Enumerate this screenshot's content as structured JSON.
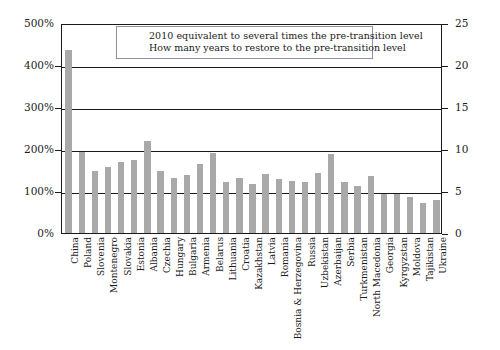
{
  "chart_data": {
    "type": "bar",
    "title": "",
    "subtitle": "",
    "xlabel": "",
    "ylabel": "",
    "ylabel_right": "",
    "ylim": [
      0,
      500
    ],
    "ylim_right": [
      0,
      25
    ],
    "ytick_labels": [
      "0%",
      "100%",
      "200%",
      "300%",
      "400%",
      "500%"
    ],
    "ytick_values": [
      0,
      100,
      200,
      300,
      400,
      500
    ],
    "ytick_labels_right": [
      "0",
      "5",
      "10",
      "15",
      "20",
      "25"
    ],
    "ytick_values_right": [
      0,
      5,
      10,
      15,
      20,
      25
    ],
    "grid": true,
    "legend_position": "none",
    "bar_color": "#a9a9a9",
    "categories": [
      "China",
      "Poland",
      "Slovenia",
      "Montenegro",
      "Slovakia",
      "Estonia",
      "Albania",
      "Czechia",
      "Hungary",
      "Bulgaria",
      "Armenia",
      "Belarus",
      "Lithuania",
      "Croatia",
      "Kazakhstan",
      "Latvia",
      "Romania",
      "Bosnia & Herzegovina",
      "Russia",
      "Uzbekistan",
      "Azerbaijan",
      "Serbia",
      "Turkmenistan",
      "North Macedonia",
      "Georgia",
      "Kyrgyzstan",
      "Moldova",
      "Tajikistan",
      "Ukraine"
    ],
    "values": [
      435,
      192,
      147,
      158,
      168,
      173,
      218,
      148,
      130,
      138,
      165,
      190,
      122,
      132,
      117,
      140,
      128,
      124,
      122,
      143,
      188,
      122,
      113,
      135,
      92,
      94,
      86,
      72,
      78
    ],
    "annotations": [
      "2010 equivalent to several times the pre-transition level",
      "How many years to restore to the pre-transition level"
    ]
  }
}
